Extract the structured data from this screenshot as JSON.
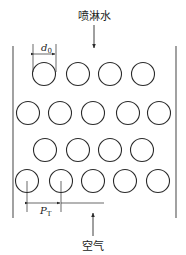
{
  "labels": {
    "top": "喷淋水",
    "bottom": "空气",
    "diameter": "d",
    "diameter_sub": "0",
    "pitch": "P",
    "pitch_sub": "T"
  },
  "colors": {
    "stroke": "#2a2a2a",
    "wall": "#555555"
  },
  "walls": {
    "left_x": 13,
    "right_x": 176,
    "top_y": 46,
    "bottom_y": 218
  },
  "rows": [
    {
      "y": 74,
      "x": [
        44,
        78,
        110,
        143
      ]
    },
    {
      "y": 113,
      "x": [
        28,
        60,
        93,
        128,
        159
      ]
    },
    {
      "y": 150,
      "x": [
        45,
        78,
        110,
        142
      ]
    },
    {
      "y": 181,
      "x": [
        27,
        61,
        93,
        125,
        158
      ]
    }
  ],
  "tube_radius": 11.5
}
